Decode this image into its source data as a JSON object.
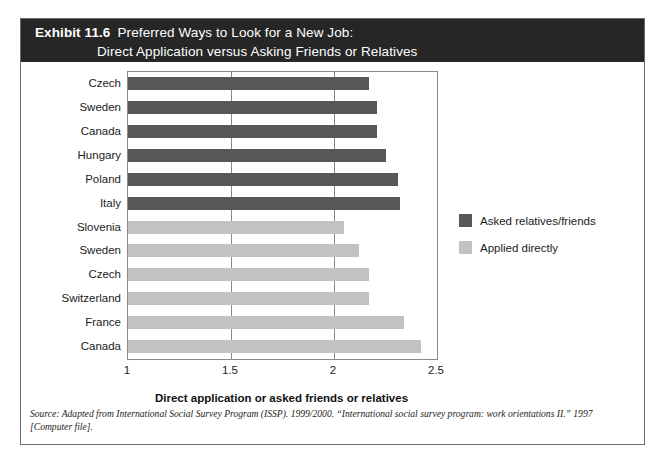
{
  "header": {
    "exhibit_label": "Exhibit 11.6",
    "title_line1": "Preferred Ways to Look for a New Job:",
    "title_line2": "Direct Application versus Asking Friends or Relatives",
    "background_color": "#262626",
    "text_color": "#ffffff"
  },
  "legend": {
    "items": [
      {
        "label": "Asked relatives/friends",
        "color": "#585858"
      },
      {
        "label": "Applied directly",
        "color": "#c2c2c2"
      }
    ]
  },
  "source": {
    "text": "Source: Adapted from International Social Survey Program (ISSP). 1999/2000. “International social survey program: work orientations II.” 1997 [Computer file]."
  },
  "chart_data": {
    "type": "bar",
    "orientation": "horizontal",
    "title": "Preferred Ways to Look for a New Job: Direct Application versus Asking Friends or Relatives",
    "xlabel": "Direct application or asked friends or relatives",
    "ylabel": "",
    "xlim": [
      1,
      2.5
    ],
    "xticks": [
      1,
      1.5,
      2,
      2.5
    ],
    "xtick_labels": [
      "1",
      "1.5",
      "2",
      "2.5"
    ],
    "grid": true,
    "grid_axis": "x",
    "legend_position": "right",
    "categories": [
      "Czech",
      "Sweden",
      "Canada",
      "Hungary",
      "Poland",
      "Italy",
      "Slovenia",
      "Sweden",
      "Czech",
      "Switzerland",
      "France",
      "Canada"
    ],
    "series": [
      {
        "name": "Asked relatives/friends",
        "color": "#585858",
        "values": [
          2.17,
          2.21,
          2.21,
          2.25,
          2.31,
          2.32,
          null,
          null,
          null,
          null,
          null,
          null
        ]
      },
      {
        "name": "Applied directly",
        "color": "#c2c2c2",
        "values": [
          null,
          null,
          null,
          null,
          null,
          null,
          2.05,
          2.12,
          2.17,
          2.17,
          2.34,
          2.42
        ]
      }
    ],
    "bars": [
      {
        "category": "Czech",
        "value": 2.17,
        "series": "Asked relatives/friends"
      },
      {
        "category": "Sweden",
        "value": 2.21,
        "series": "Asked relatives/friends"
      },
      {
        "category": "Canada",
        "value": 2.21,
        "series": "Asked relatives/friends"
      },
      {
        "category": "Hungary",
        "value": 2.25,
        "series": "Asked relatives/friends"
      },
      {
        "category": "Poland",
        "value": 2.31,
        "series": "Asked relatives/friends"
      },
      {
        "category": "Italy",
        "value": 2.32,
        "series": "Asked relatives/friends"
      },
      {
        "category": "Slovenia",
        "value": 2.05,
        "series": "Applied directly"
      },
      {
        "category": "Sweden",
        "value": 2.12,
        "series": "Applied directly"
      },
      {
        "category": "Czech",
        "value": 2.17,
        "series": "Applied directly"
      },
      {
        "category": "Switzerland",
        "value": 2.17,
        "series": "Applied directly"
      },
      {
        "category": "France",
        "value": 2.34,
        "series": "Applied directly"
      },
      {
        "category": "Canada",
        "value": 2.42,
        "series": "Applied directly"
      }
    ]
  }
}
